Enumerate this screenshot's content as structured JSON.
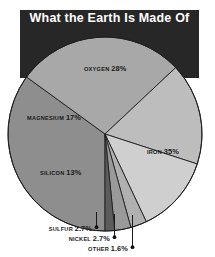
{
  "figure": {
    "title": "What the Earth Is Made Of",
    "title_bar_color": "#272727",
    "title_text_color": "#ffffff",
    "background_color": "#ffffff"
  },
  "chart_data": {
    "type": "pie",
    "title": "What the Earth Is Made Of",
    "xlabel": "",
    "ylabel": "",
    "units": "percent",
    "legend": "none",
    "grid": false,
    "labels_inline": true,
    "total": 100,
    "categories": [
      "IRON",
      "OXYGEN",
      "MAGNESIUM",
      "SILICON",
      "SULFUR",
      "NICKEL",
      "OTHER"
    ],
    "values": [
      35,
      28,
      17,
      13,
      2.7,
      2.7,
      1.6
    ],
    "slices": [
      {
        "name": "iron-slice",
        "label": "IRON",
        "value": 35,
        "value_text": "35%",
        "color": "#8e8e8e",
        "label_placement": "inside",
        "callout": false
      },
      {
        "name": "oxygen-slice",
        "label": "OXYGEN",
        "value": 28,
        "value_text": "28%",
        "color": "#a8a8a8",
        "label_placement": "inside",
        "callout": false
      },
      {
        "name": "magnesium-slice",
        "label": "MAGNESIUM",
        "value": 17,
        "value_text": "17%",
        "color": "#bdbdbd",
        "label_placement": "inside",
        "callout": false
      },
      {
        "name": "silicon-slice",
        "label": "SILICON",
        "value": 13,
        "value_text": "13%",
        "color": "#cfcfcf",
        "label_placement": "inside",
        "callout": false
      },
      {
        "name": "sulfur-slice",
        "label": "SULFUR",
        "value": 2.7,
        "value_text": "2.7%",
        "color": "#b0b0b0",
        "label_placement": "callout",
        "callout": true
      },
      {
        "name": "nickel-slice",
        "label": "NICKEL",
        "value": 2.7,
        "value_text": "2.7%",
        "color": "#9a9a9a",
        "label_placement": "callout",
        "callout": true
      },
      {
        "name": "other-slice",
        "label": "OTHER",
        "value": 1.6,
        "value_text": "1.6%",
        "color": "#5c5c5c",
        "label_placement": "callout",
        "callout": true
      }
    ]
  }
}
